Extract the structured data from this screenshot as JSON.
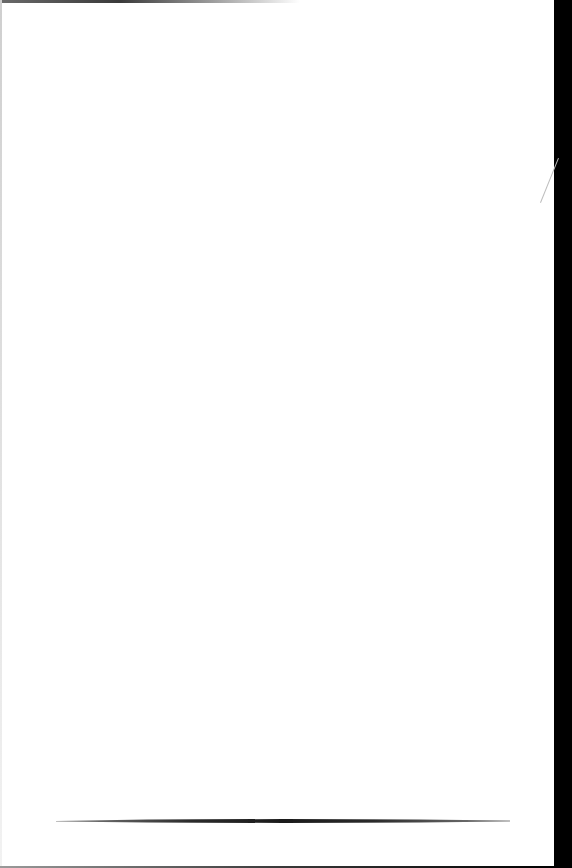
{
  "page": {
    "background_color": "#ffffff",
    "margin_color": "#000000"
  },
  "decorations": {
    "footer_rule": {
      "x_start": 56,
      "x_end": 510,
      "y": 821,
      "style": "tapered"
    }
  }
}
